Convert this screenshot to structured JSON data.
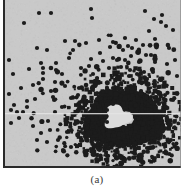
{
  "figure": {
    "caption": "(a)",
    "panel_label": "(a)",
    "background_color": "#c9c9c9",
    "dot_color": "#1c1c1c",
    "axis_color": "#2a2a2a",
    "hole_color": "#dcdcdc",
    "page_color": "#ffffff",
    "width": 178,
    "height": 168
  },
  "chart_data": {
    "type": "scatter",
    "title": "",
    "subtitle": "",
    "xlabel": "",
    "ylabel": "",
    "xlim": [
      0,
      178
    ],
    "ylim": [
      0,
      168
    ],
    "grid": false,
    "legend": null,
    "annotations": [
      {
        "text": "(a)",
        "role": "panel-label",
        "position": "below-axes"
      }
    ],
    "axes_style": {
      "left_spine": true,
      "bottom_spine": true,
      "top_spine": false,
      "right_spine": false
    },
    "marker": {
      "shape": "circle",
      "size_px": 4.2,
      "color": "#1c1c1c"
    },
    "scan_artifact": {
      "type": "horizontal-light-line",
      "y": 113,
      "color": "#e4e4e4"
    },
    "series": [
      {
        "name": "scattered sources",
        "color": "#1c1c1c",
        "points": [
          [
            36,
            13
          ],
          [
            48,
            13
          ],
          [
            21,
            23
          ],
          [
            89,
            18
          ],
          [
            88,
            9
          ],
          [
            142,
            11
          ],
          [
            151,
            19
          ],
          [
            159,
            15
          ],
          [
            158,
            22
          ],
          [
            163,
            26
          ],
          [
            110,
            42
          ],
          [
            133,
            40
          ],
          [
            140,
            45
          ],
          [
            122,
            38
          ],
          [
            125,
            46
          ],
          [
            129,
            48
          ],
          [
            146,
            31
          ],
          [
            152,
            39
          ],
          [
            62,
            41
          ],
          [
            72,
            41
          ],
          [
            83,
            43
          ],
          [
            96,
            40
          ],
          [
            107,
            47
          ],
          [
            120,
            50
          ],
          [
            136,
            51
          ],
          [
            143,
            55
          ],
          [
            38,
            63
          ],
          [
            40,
            68
          ],
          [
            40,
            73
          ],
          [
            40,
            79
          ],
          [
            53,
            63
          ],
          [
            53,
            70
          ],
          [
            59,
            74
          ],
          [
            30,
            85
          ],
          [
            10,
            74
          ],
          [
            88,
            59
          ],
          [
            97,
            53
          ],
          [
            100,
            61
          ],
          [
            110,
            58
          ],
          [
            122,
            60
          ],
          [
            118,
            67
          ],
          [
            127,
            70
          ],
          [
            148,
            55
          ],
          [
            152,
            62
          ],
          [
            141,
            72
          ],
          [
            86,
            66
          ],
          [
            90,
            74
          ],
          [
            52,
            82
          ],
          [
            62,
            86
          ],
          [
            76,
            88
          ],
          [
            75,
            95
          ],
          [
            68,
            98
          ],
          [
            48,
            91
          ],
          [
            50,
            97
          ],
          [
            32,
            99
          ],
          [
            24,
            101
          ],
          [
            11,
            105
          ],
          [
            14,
            112
          ],
          [
            20,
            112
          ],
          [
            24,
            107
          ],
          [
            8,
            110
          ],
          [
            16,
            118
          ],
          [
            8,
            123
          ],
          [
            30,
            126
          ],
          [
            45,
            121
          ],
          [
            52,
            112
          ],
          [
            59,
            107
          ],
          [
            47,
            130
          ],
          [
            38,
            133
          ],
          [
            34,
            140
          ],
          [
            44,
            142
          ],
          [
            55,
            140
          ],
          [
            64,
            132
          ],
          [
            72,
            124
          ],
          [
            80,
            133
          ],
          [
            78,
            141
          ],
          [
            68,
            147
          ],
          [
            60,
            150
          ],
          [
            88,
            149
          ],
          [
            95,
            143
          ],
          [
            100,
            131
          ],
          [
            104,
            122
          ],
          [
            86,
            113
          ],
          [
            82,
            105
          ],
          [
            94,
            99
          ],
          [
            100,
            92
          ],
          [
            110,
            88
          ],
          [
            118,
            83
          ],
          [
            128,
            86
          ],
          [
            138,
            91
          ],
          [
            148,
            97
          ],
          [
            156,
            104
          ],
          [
            160,
            112
          ],
          [
            154,
            120
          ],
          [
            146,
            128
          ],
          [
            138,
            133
          ],
          [
            130,
            140
          ],
          [
            120,
            146
          ],
          [
            112,
            151
          ],
          [
            104,
            156
          ],
          [
            96,
            160
          ],
          [
            118,
            158
          ],
          [
            132,
            154
          ],
          [
            144,
            148
          ],
          [
            152,
            140
          ],
          [
            160,
            131
          ],
          [
            166,
            122
          ],
          [
            162,
            95
          ],
          [
            152,
            86
          ],
          [
            144,
            79
          ],
          [
            134,
            74
          ],
          [
            126,
            76
          ],
          [
            118,
            96
          ],
          [
            110,
            104
          ],
          [
            104,
            110
          ],
          [
            90,
            120
          ],
          [
            84,
            128
          ],
          [
            92,
            133
          ],
          [
            100,
            140
          ],
          [
            108,
            144
          ],
          [
            116,
            138
          ],
          [
            124,
            130
          ],
          [
            132,
            122
          ],
          [
            140,
            114
          ],
          [
            148,
            110
          ],
          [
            156,
            117
          ],
          [
            164,
            108
          ],
          [
            168,
            140
          ],
          [
            170,
            100
          ],
          [
            172,
            60
          ],
          [
            166,
            48
          ],
          [
            170,
            30
          ],
          [
            174,
            76
          ],
          [
            6,
            60
          ],
          [
            6,
            94
          ],
          [
            18,
            88
          ],
          [
            26,
            69
          ],
          [
            66,
            58
          ],
          [
            70,
            50
          ],
          [
            78,
            68
          ],
          [
            94,
            78
          ],
          [
            106,
            68
          ],
          [
            114,
            60
          ],
          [
            128,
            56
          ],
          [
            136,
            62
          ],
          [
            150,
            72
          ],
          [
            158,
            80
          ],
          [
            164,
            64
          ],
          [
            44,
            50
          ],
          [
            34,
            48
          ]
        ]
      },
      {
        "name": "dense cluster",
        "color": "#1c1c1c",
        "center": [
          121,
          118
        ],
        "outer_radius": 40,
        "inner_hole_radius": 13,
        "density": "saturated",
        "description": "Large saturated blob of overlapping dots with a clear lighter circular void at its core, surrounded by a halo of sparser dots fading outward."
      }
    ]
  }
}
